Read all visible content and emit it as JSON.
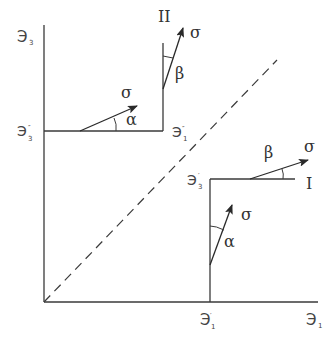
{
  "diagram": {
    "axes": {
      "y_label": "Э",
      "y_sub": "3",
      "x_label": "Э",
      "x_sub": "1"
    },
    "panel_ii": {
      "roman": "II",
      "corner_label": "Э",
      "corner_sub": "1",
      "corner_prime": "″",
      "axis_label": "Э",
      "axis_sub": "3",
      "axis_prime": "″",
      "vector_vertical": {
        "label": "σ",
        "angle": "β"
      },
      "vector_horizontal": {
        "label": "σ",
        "angle": "α"
      }
    },
    "panel_i": {
      "roman": "I",
      "corner_label": "Э",
      "corner_sub": "3",
      "corner_prime": "′",
      "axis_label": "Э",
      "axis_sub": "1",
      "axis_prime": "′",
      "vector_vertical": {
        "label": "σ",
        "angle": "α"
      },
      "vector_horizontal": {
        "label": "σ",
        "angle": "β"
      }
    },
    "colors": {
      "line": "#3a3a3a",
      "text": "#333333",
      "background": "#ffffff"
    }
  }
}
